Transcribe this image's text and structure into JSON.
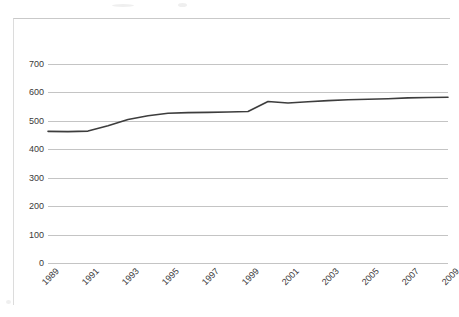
{
  "figure": {
    "title": "",
    "background_color": "#ffffff",
    "border_color": "#dcdcdc"
  },
  "axis": {
    "y_tick_labels": [
      "700",
      "600",
      "500",
      "400",
      "300",
      "200",
      "100",
      "0"
    ],
    "x_tick_labels": [
      "1989",
      "1991",
      "1993",
      "1995",
      "1997",
      "1999",
      "2001",
      "2003",
      "2005",
      "2007",
      "2009"
    ]
  },
  "chart_data": {
    "type": "line",
    "title": "",
    "xlabel": "",
    "ylabel": "",
    "x": [
      1989,
      1990,
      1991,
      1992,
      1993,
      1994,
      1995,
      1996,
      1997,
      1998,
      1999,
      2000,
      2001,
      2002,
      2003,
      2004,
      2005,
      2006,
      2007,
      2008,
      2009
    ],
    "series": [
      {
        "name": "Series 1",
        "color": "#3d3d3d",
        "values": [
          463,
          462,
          464,
          483,
          505,
          518,
          527,
          529,
          530,
          531,
          533,
          568,
          563,
          567,
          571,
          574,
          576,
          578,
          581,
          582,
          583
        ]
      }
    ],
    "categories": [
      "1989",
      "1990",
      "1991",
      "1992",
      "1993",
      "1994",
      "1995",
      "1996",
      "1997",
      "1998",
      "1999",
      "2000",
      "2001",
      "2002",
      "2003",
      "2004",
      "2005",
      "2006",
      "2007",
      "2008",
      "2009"
    ],
    "ylim": [
      0,
      700
    ],
    "xlim": [
      1989,
      2009
    ],
    "y_ticks": [
      0,
      100,
      200,
      300,
      400,
      500,
      600,
      700
    ],
    "x_ticks": [
      1989,
      1991,
      1993,
      1995,
      1997,
      1999,
      2001,
      2003,
      2005,
      2007,
      2009
    ],
    "grid": true,
    "grid_axis": "y",
    "grid_color": "#c4c4c4",
    "legend": false,
    "legend_position": "none",
    "markers": false,
    "line_width": 1.6
  }
}
